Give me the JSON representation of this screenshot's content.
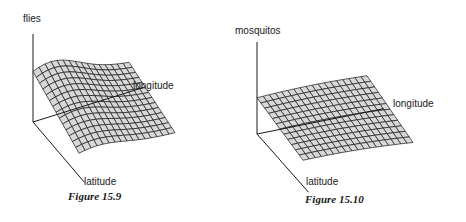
{
  "figures": [
    {
      "caption": "Figure 15.9",
      "z_label": "flies",
      "x_label": "longitude",
      "y_label": "latitude",
      "surface": "hump"
    },
    {
      "caption": "Figure 15.10",
      "z_label": "mosquitos",
      "x_label": "longitude",
      "y_label": "latitude",
      "surface": "flat-curved"
    }
  ],
  "chart_data": [
    {
      "type": "surface",
      "title": "Figure 15.9",
      "axes": {
        "x": "longitude",
        "y": "latitude",
        "z": "flies"
      },
      "description": "Wireframe surface with a high ridge near the latitude-axis origin, falling off toward high longitude"
    },
    {
      "type": "surface",
      "title": "Figure 15.10",
      "axes": {
        "x": "longitude",
        "y": "latitude",
        "z": "mosquitos"
      },
      "description": "Nearly flat, gently curved wireframe surface at moderate height"
    }
  ],
  "colors": {
    "line": "#1a1a1a",
    "fill": "#d8d8d8"
  }
}
